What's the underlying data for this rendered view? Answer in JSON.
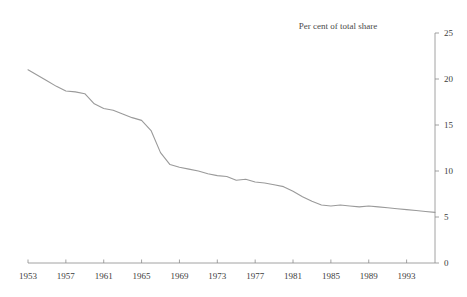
{
  "chart_data": {
    "type": "line",
    "title": "Per cent of total share",
    "xlabel": "",
    "ylabel": "",
    "xlim": [
      1953,
      1996
    ],
    "ylim": [
      0,
      25
    ],
    "grid": false,
    "legend": "none",
    "y_axis_position": "right",
    "title_position": "top-right-of-plot",
    "xticks": [
      1953,
      1957,
      1961,
      1965,
      1969,
      1973,
      1977,
      1981,
      1985,
      1989,
      1993
    ],
    "xtick_labels": [
      "1953",
      "1957",
      "1961",
      "1965",
      "1969",
      "1973",
      "1977",
      "1981",
      "1985",
      "1989",
      "1993"
    ],
    "yticks": [
      0,
      5,
      10,
      15,
      20,
      25
    ],
    "ytick_labels": [
      "0",
      "5",
      "10",
      "15",
      "20",
      "25"
    ],
    "series": [
      {
        "name": "Per cent of total share",
        "color": "#9a9a9a",
        "x": [
          1953,
          1954,
          1955,
          1956,
          1957,
          1958,
          1959,
          1960,
          1961,
          1962,
          1963,
          1964,
          1965,
          1966,
          1967,
          1968,
          1969,
          1970,
          1971,
          1972,
          1973,
          1974,
          1975,
          1976,
          1977,
          1978,
          1979,
          1980,
          1981,
          1982,
          1983,
          1984,
          1985,
          1986,
          1987,
          1988,
          1989,
          1990,
          1991,
          1992,
          1993,
          1994,
          1995,
          1996
        ],
        "values": [
          21.0,
          20.4,
          19.8,
          19.2,
          18.7,
          18.6,
          18.4,
          17.3,
          16.8,
          16.6,
          16.2,
          15.8,
          15.5,
          14.4,
          12.0,
          10.7,
          10.4,
          10.2,
          10.0,
          9.7,
          9.5,
          9.4,
          9.0,
          9.1,
          8.8,
          8.7,
          8.5,
          8.3,
          7.8,
          7.2,
          6.7,
          6.3,
          6.2,
          6.3,
          6.2,
          6.1,
          6.2,
          6.1,
          6.0,
          5.9,
          5.8,
          5.7,
          5.6,
          5.5
        ]
      }
    ]
  }
}
